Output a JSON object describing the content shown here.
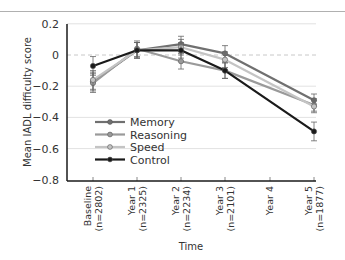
{
  "chart_data": {
    "type": "line",
    "title": "",
    "xlabel": "Time",
    "ylabel": "Mean IADL difficulty score",
    "ylim": [
      -0.8,
      0.2
    ],
    "yticks": [
      0.2,
      0,
      -0.2,
      -0.4,
      -0.6,
      -0.8
    ],
    "ytick_labels": [
      "0.2",
      "0",
      "−0.2",
      "−0.4",
      "−0.6",
      "−0.8"
    ],
    "grid": "horizontal",
    "reference_line": {
      "y": 0,
      "style": "dashed"
    },
    "categories": [
      {
        "line1": "Baseline",
        "line2": "(n=2802)"
      },
      {
        "line1": "Year 1",
        "line2": "(n=2325)"
      },
      {
        "line1": "Year 2",
        "line2": "(n=2234)"
      },
      {
        "line1": "Year 3",
        "line2": "(n=2101)"
      },
      {
        "line1": "Year 4",
        "line2": ""
      },
      {
        "line1": "Year 5",
        "line2": "(n=1877)"
      }
    ],
    "legend_position": "inside-lower-left",
    "series": [
      {
        "name": "Memory",
        "color": "#707070",
        "values": [
          -0.17,
          0.03,
          0.07,
          0.01,
          null,
          -0.29
        ],
        "errors": [
          0.06,
          0.05,
          0.05,
          0.05,
          null,
          0.04
        ]
      },
      {
        "name": "Reasoning",
        "color": "#9a9a9a",
        "values": [
          -0.18,
          0.04,
          -0.04,
          -0.1,
          null,
          -0.32
        ],
        "errors": [
          0.06,
          0.05,
          0.05,
          0.05,
          null,
          0.04
        ]
      },
      {
        "name": "Speed",
        "color": "#c4c4c4",
        "values": [
          -0.16,
          0.03,
          0.05,
          -0.03,
          null,
          -0.33
        ],
        "errors": [
          0.06,
          0.05,
          0.05,
          0.05,
          null,
          0.04
        ]
      },
      {
        "name": "Control",
        "color": "#1a1a1a",
        "values": [
          -0.07,
          0.03,
          0.03,
          -0.1,
          null,
          -0.49
        ],
        "errors": [
          0.06,
          0.05,
          0.05,
          0.05,
          null,
          0.06
        ]
      }
    ]
  }
}
